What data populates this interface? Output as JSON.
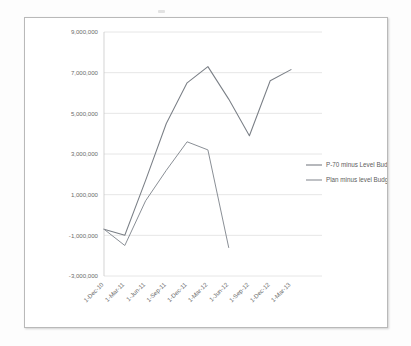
{
  "chart_data": {
    "type": "line",
    "title": "",
    "subtitle": "",
    "xlabel": "",
    "ylabel": "",
    "grid": true,
    "legend_position": "right",
    "ylim": [
      -3000000,
      9000000
    ],
    "ytick_labels": [
      "9,000,000",
      "7,000,000",
      "5,000,000",
      "3,000,000",
      "1,000,000",
      "-1,000,000",
      "-3,000,000"
    ],
    "ytick_values": [
      9000000,
      7000000,
      5000000,
      3000000,
      1000000,
      -1000000,
      -3000000
    ],
    "categories": [
      "1-Dec-10",
      "1-Mar-11",
      "1-Jun-11",
      "1-Sep-11",
      "1-Dec-11",
      "1-Mar-12",
      "1-Jun-12",
      "1-Sep-12",
      "1-Dec-12",
      "1-Mar-13"
    ],
    "series": [
      {
        "name": "P-70 minus Level Budget",
        "color": "#7a7f86",
        "values": [
          -700000,
          -1000000,
          1700000,
          4500000,
          6500000,
          7300000,
          5700000,
          3900000,
          6600000,
          7150000
        ]
      },
      {
        "name": "Plan minus level Budget",
        "color": "#8a8f96",
        "values": [
          -700000,
          -1500000,
          700000,
          2200000,
          3600000,
          3200000,
          -1600000,
          null,
          null,
          null
        ]
      }
    ]
  },
  "legend": {
    "items": [
      {
        "label": "P-70 minus Level Budget"
      },
      {
        "label": "Plan minus level Budget"
      }
    ]
  },
  "colors": {
    "series_1": "#7a7f86",
    "series_2": "#8a8f96",
    "grid": "#d2d2d2",
    "axis": "#c2c2c2",
    "frame": "#b9b9b9",
    "text": "#6b6b6b"
  }
}
